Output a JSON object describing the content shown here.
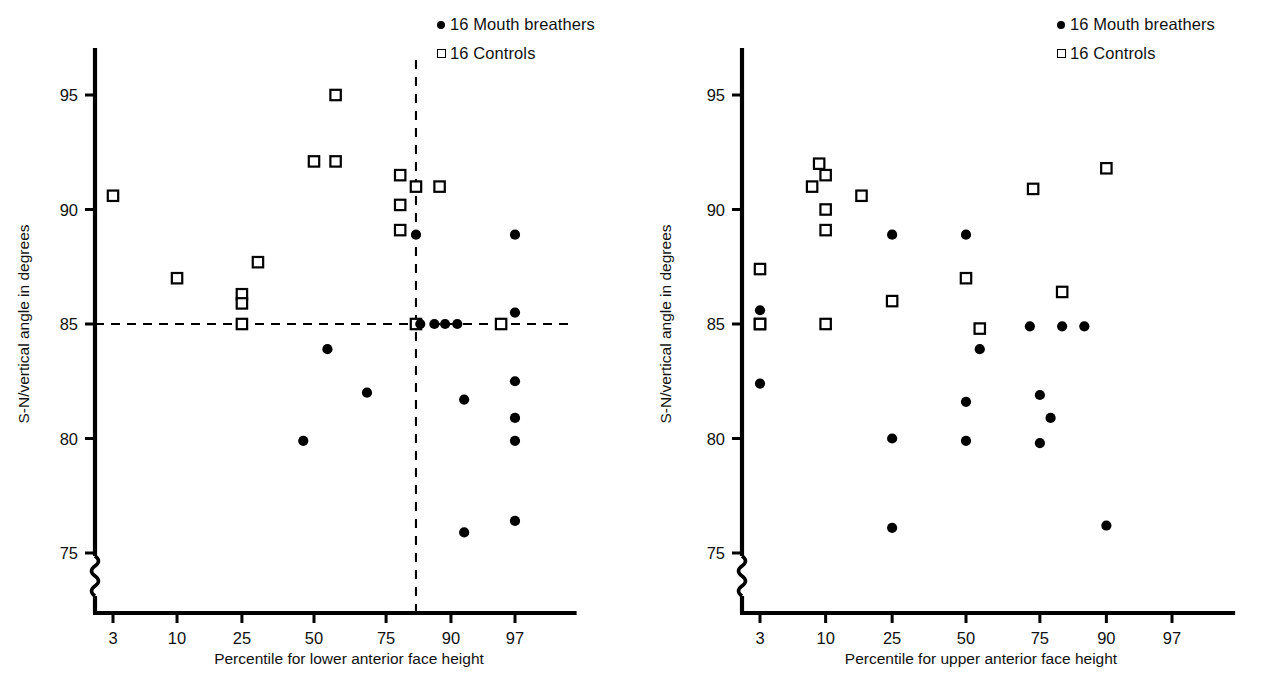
{
  "figure": {
    "background": "#ffffff",
    "ink_color": "#000000"
  },
  "legend": {
    "items": [
      {
        "marker": "filled-circle",
        "label": "16 Mouth breathers"
      },
      {
        "marker": "open-square",
        "label": "16 Controls"
      }
    ]
  },
  "chart_data": [
    {
      "id": "left",
      "type": "scatter",
      "title": "",
      "xlabel": "Percentile for lower anterior face height",
      "ylabel": "S-N/vertical angle in degrees",
      "xticks": [
        3,
        10,
        25,
        50,
        75,
        90,
        97
      ],
      "xticklabels": [
        "3",
        "10",
        "25",
        "50",
        "75",
        "90",
        "97"
      ],
      "yticks": [
        75,
        80,
        85,
        90,
        95
      ],
      "yticklabels": [
        "75",
        "80",
        "85",
        "90",
        "95"
      ],
      "ylim": [
        73.2,
        96.8
      ],
      "axis_break": true,
      "grid": false,
      "legend_position": "top-right",
      "reference_lines": [
        {
          "orientation": "horizontal",
          "value": 85,
          "style": "dashed",
          "label": ""
        },
        {
          "orientation": "vertical",
          "value": 83,
          "style": "dashed",
          "label": ""
        }
      ],
      "series": [
        {
          "name": "16 Controls",
          "marker": "open-square",
          "points": [
            [
              3,
              90.6
            ],
            [
              10,
              87.0
            ],
            [
              25,
              86.3
            ],
            [
              25,
              85.9
            ],
            [
              25,
              85.0
            ],
            [
              30,
              87.7
            ],
            [
              50,
              92.1
            ],
            [
              58,
              95.0
            ],
            [
              58,
              92.1
            ],
            [
              79,
              91.5
            ],
            [
              79,
              90.2
            ],
            [
              79,
              89.1
            ],
            [
              83,
              91.0
            ],
            [
              83,
              85.0
            ],
            [
              88,
              91.0
            ],
            [
              96,
              85.0
            ]
          ]
        },
        {
          "name": "16 Mouth breathers",
          "marker": "filled-circle",
          "points": [
            [
              46,
              79.9
            ],
            [
              55,
              83.9
            ],
            [
              69,
              82.0
            ],
            [
              83,
              88.9
            ],
            [
              84,
              85.0
            ],
            [
              87,
              85.0
            ],
            [
              89,
              85.0
            ],
            [
              91,
              85.0
            ],
            [
              92,
              81.7
            ],
            [
              92,
              75.9
            ],
            [
              97,
              88.9
            ],
            [
              97,
              85.5
            ],
            [
              97,
              82.5
            ],
            [
              97,
              80.9
            ],
            [
              97,
              79.9
            ],
            [
              97,
              76.4
            ]
          ]
        }
      ]
    },
    {
      "id": "right",
      "type": "scatter",
      "title": "",
      "xlabel": "Percentile for upper anterior face height",
      "ylabel": "S-N/vertical angle in degrees",
      "xticks": [
        3,
        10,
        25,
        50,
        75,
        90,
        97
      ],
      "xticklabels": [
        "3",
        "10",
        "25",
        "50",
        "75",
        "90",
        "97"
      ],
      "yticks": [
        75,
        80,
        85,
        90,
        95
      ],
      "yticklabels": [
        "75",
        "80",
        "85",
        "90",
        "95"
      ],
      "ylim": [
        73.2,
        96.8
      ],
      "axis_break": true,
      "grid": false,
      "legend_position": "top-right",
      "reference_lines": [],
      "series": [
        {
          "name": "16 Controls",
          "marker": "open-square",
          "points": [
            [
              3,
              87.4
            ],
            [
              3,
              85.0
            ],
            [
              8,
              91.0
            ],
            [
              9,
              92.0
            ],
            [
              10,
              91.5
            ],
            [
              10,
              90.0
            ],
            [
              10,
              89.1
            ],
            [
              10,
              85.0
            ],
            [
              17,
              90.6
            ],
            [
              25,
              86.0
            ],
            [
              50,
              87.0
            ],
            [
              55,
              84.8
            ],
            [
              73,
              90.9
            ],
            [
              81,
              86.4
            ],
            [
              90,
              91.8
            ],
            [
              3,
              85.0
            ]
          ]
        },
        {
          "name": "16 Mouth breathers",
          "marker": "filled-circle",
          "points": [
            [
              3,
              85.6
            ],
            [
              3,
              82.4
            ],
            [
              25,
              88.9
            ],
            [
              25,
              80.0
            ],
            [
              25,
              76.1
            ],
            [
              50,
              88.9
            ],
            [
              50,
              81.6
            ],
            [
              50,
              79.9
            ],
            [
              55,
              83.9
            ],
            [
              72,
              84.9
            ],
            [
              75,
              81.9
            ],
            [
              75,
              79.8
            ],
            [
              78,
              80.9
            ],
            [
              81,
              84.9
            ],
            [
              86,
              84.9
            ],
            [
              90,
              76.2
            ]
          ]
        }
      ]
    }
  ]
}
